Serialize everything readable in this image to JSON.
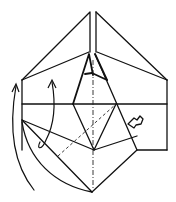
{
  "diagram": {
    "title": "",
    "type": "origami-folding-step",
    "colors": {
      "line": "#111111",
      "background": "#ffffff"
    },
    "symbols": [
      {
        "name": "fold-arrow-left-outer",
        "meaning": "fold flap upward"
      },
      {
        "name": "fold-arrow-left-inner",
        "meaning": "fold flap upward"
      },
      {
        "name": "push-arrow-right",
        "meaning": "push / squash indicator"
      },
      {
        "name": "valley-fold-line",
        "meaning": "diagonal dashed valley fold"
      },
      {
        "name": "center-crease-line",
        "meaning": "vertical center crease"
      }
    ]
  }
}
